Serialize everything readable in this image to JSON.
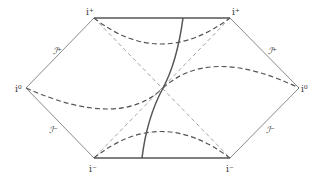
{
  "diagram": {
    "type": "Penrose diagram",
    "labels": {
      "future_timelike_infinity_left": "i⁺",
      "future_timelike_infinity_right": "i⁺",
      "spatial_infinity_left": "i⁰",
      "spatial_infinity_right": "i⁰",
      "past_timelike_infinity_left": "i⁻",
      "past_timelike_infinity_right": "i⁻",
      "future_null_infinity_left": "ℐ⁺",
      "future_null_infinity_right": "ℐ⁺",
      "past_null_infinity_left": "ℐ⁻",
      "past_null_infinity_right": "ℐ⁻"
    },
    "colors": {
      "boundary": "#8a8a8a",
      "singularity": "#555555",
      "worldline": "#555555",
      "dashed_curves": "#555555",
      "light_cone": "#999999"
    }
  }
}
